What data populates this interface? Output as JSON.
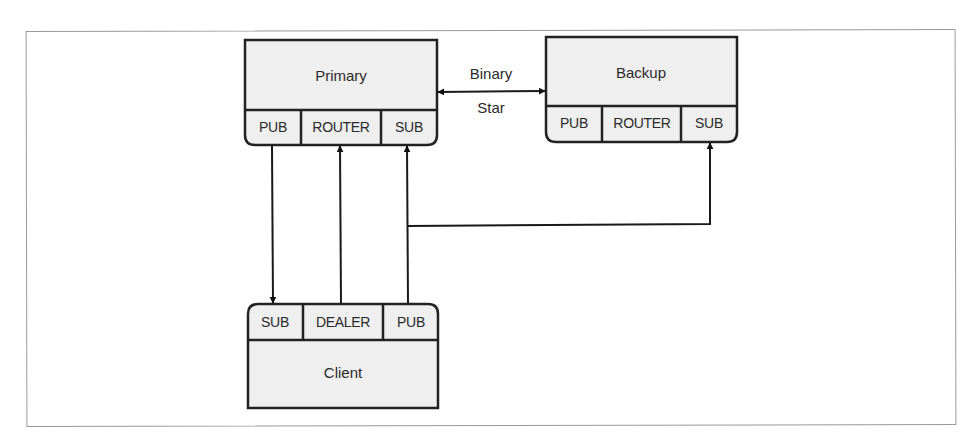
{
  "diagram": {
    "nodes": {
      "primary": {
        "label": "Primary",
        "ports": [
          "PUB",
          "ROUTER",
          "SUB"
        ]
      },
      "backup": {
        "label": "Backup",
        "ports": [
          "PUB",
          "ROUTER",
          "SUB"
        ]
      },
      "client": {
        "label": "Client",
        "ports": [
          "SUB",
          "DEALER",
          "PUB"
        ]
      }
    },
    "edges": [
      {
        "from": "primary.PUB",
        "to": "client.SUB",
        "direction": "one-way"
      },
      {
        "from": "client.DEALER",
        "to": "primary.ROUTER",
        "direction": "one-way"
      },
      {
        "from": "client.PUB",
        "to": "primary.SUB",
        "direction": "one-way"
      },
      {
        "from": "client.PUB",
        "to": "backup.SUB",
        "direction": "one-way"
      },
      {
        "from": "primary",
        "to": "backup",
        "direction": "bidirectional",
        "label_line1": "Binary",
        "label_line2": "Star"
      }
    ],
    "binary_star": {
      "line1": "Binary",
      "line2": "Star"
    },
    "colors": {
      "box_fill": "#efefef",
      "stroke": "#222222",
      "frame": "#9a9a9a"
    }
  }
}
